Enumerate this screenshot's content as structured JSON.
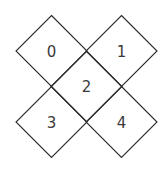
{
  "diagram": {
    "cells": [
      {
        "label": "0",
        "cx": 51.5,
        "cy": 51
      },
      {
        "label": "1",
        "cx": 121.5,
        "cy": 51
      },
      {
        "label": "2",
        "cx": 86.5,
        "cy": 86.5
      },
      {
        "label": "3",
        "cx": 51.5,
        "cy": 122
      },
      {
        "label": "4",
        "cx": 121.5,
        "cy": 122
      }
    ],
    "half_diagonal": 35.5,
    "colors": {
      "stroke": "#2a2a2a",
      "text": "#3a3a3a",
      "background": "#ffffff"
    }
  }
}
